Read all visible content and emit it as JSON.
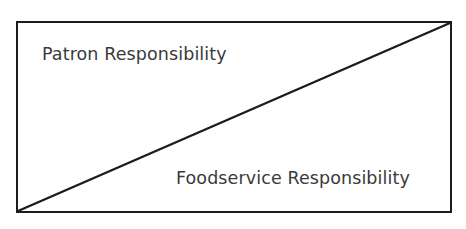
{
  "figure": {
    "type": "diagram",
    "shape": "rectangle-with-diagonal",
    "background_color": "#ffffff",
    "line_color": "#1c1c1c",
    "text_color": "#3a3a3a",
    "regions": [
      {
        "id": "upper-left-region",
        "label": "Patron Responsibility",
        "position": "upper-left"
      },
      {
        "id": "lower-right-region",
        "label": "Foodservice Responsibility",
        "position": "lower-right"
      }
    ],
    "divider": {
      "name": "diagonal-divider-line",
      "from": "bottom-left-corner",
      "to": "top-right-corner"
    }
  }
}
